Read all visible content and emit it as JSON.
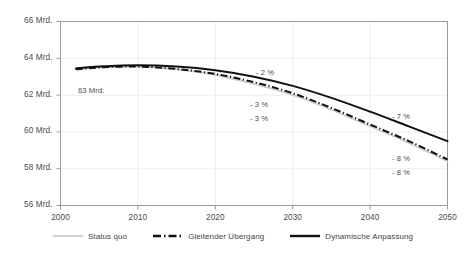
{
  "chart_data": {
    "type": "line",
    "title": "",
    "xlabel": "",
    "ylabel": "",
    "xlim": [
      2000,
      2050
    ],
    "ylim": [
      56,
      66
    ],
    "grid": true,
    "legend_position": "bottom",
    "y_ticks": [
      "56 Mrd.",
      "58 Mrd.",
      "60 Mrd.",
      "62 Mrd.",
      "64 Mrd.",
      "66 Mrd."
    ],
    "y_tick_values": [
      56,
      58,
      60,
      62,
      64,
      66
    ],
    "x_ticks": [
      "2000",
      "2010",
      "2020",
      "2030",
      "2040",
      "2050"
    ],
    "x_tick_values": [
      2000,
      2010,
      2020,
      2030,
      2040,
      2050
    ],
    "x": [
      2002,
      2005,
      2010,
      2015,
      2020,
      2025,
      2030,
      2035,
      2040,
      2045,
      2050
    ],
    "series": [
      {
        "name": "Status quo",
        "style": "solid-light",
        "color": "#c9c9c9",
        "values": [
          63.4,
          63.5,
          63.55,
          63.4,
          63.1,
          62.6,
          62.0,
          61.2,
          60.3,
          59.4,
          58.4
        ]
      },
      {
        "name": "Gleitender Übergang",
        "style": "dash-dot",
        "color": "#111111",
        "values": [
          63.4,
          63.5,
          63.55,
          63.42,
          63.15,
          62.7,
          62.1,
          61.3,
          60.4,
          59.5,
          58.5
        ]
      },
      {
        "name": "Dynamische Anpassung",
        "style": "solid-bold",
        "color": "#111111",
        "values": [
          63.45,
          63.55,
          63.62,
          63.55,
          63.35,
          63.0,
          62.5,
          61.85,
          61.1,
          60.3,
          59.5
        ]
      }
    ],
    "annotations": [
      {
        "text": "63 Mrd.",
        "x": 78,
        "y": 86
      },
      {
        "text": "- 2 %",
        "x": 256,
        "y": 68
      },
      {
        "text": "- 3 %",
        "x": 250,
        "y": 100
      },
      {
        "text": "- 3 %",
        "x": 250,
        "y": 114
      },
      {
        "text": "- 7 %",
        "x": 392,
        "y": 112
      },
      {
        "text": "- 8 %",
        "x": 392,
        "y": 154
      },
      {
        "text": "- 8 %",
        "x": 392,
        "y": 168
      }
    ]
  },
  "legend": {
    "items": [
      {
        "label": "Status quo"
      },
      {
        "label": "Gleitender Übergang"
      },
      {
        "label": "Dynamische Anpassung"
      }
    ]
  }
}
